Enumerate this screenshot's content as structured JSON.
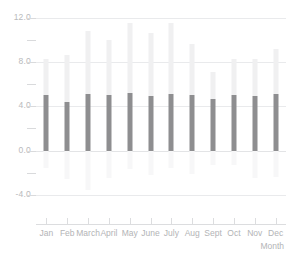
{
  "chart_data": {
    "type": "bar",
    "title": "",
    "subtitle": "",
    "xlabel": "Month",
    "ylabel": "",
    "categories": [
      "Jan",
      "Feb",
      "March",
      "April",
      "May",
      "June",
      "July",
      "Aug",
      "Sept",
      "Oct",
      "Nov",
      "Dec"
    ],
    "ylim": [
      -5.0,
      12.6
    ],
    "y_ticks_major": [
      "12.0",
      "8.0",
      "4.0",
      "0.0",
      "-4.0"
    ],
    "y_ticks_major_values": [
      12.0,
      8.0,
      4.0,
      0.0,
      -4.0
    ],
    "y_ticks_minor_values": [
      10.0,
      6.0,
      2.0,
      -2.0
    ],
    "grid": true,
    "legend": "none",
    "stacked": true,
    "series": [
      {
        "name": "lower",
        "color": "#f7f7f8",
        "values": [
          -1.6,
          -2.6,
          -3.6,
          -2.5,
          -1.7,
          -2.2,
          -1.6,
          -2.1,
          -1.3,
          -1.3,
          -2.5,
          -2.4
        ]
      },
      {
        "name": "middle",
        "color": "#8e8e90",
        "values": [
          5.0,
          4.4,
          5.1,
          5.0,
          5.2,
          4.9,
          5.1,
          5.0,
          4.7,
          5.0,
          4.9,
          5.1
        ]
      },
      {
        "name": "upper",
        "color": "#f0f0f1",
        "values": [
          3.3,
          4.2,
          5.7,
          5.0,
          6.3,
          5.7,
          6.4,
          4.6,
          2.4,
          3.3,
          3.4,
          4.1
        ]
      }
    ],
    "bar_tops": [
      8.3,
      8.6,
      10.8,
      10.0,
      11.5,
      10.6,
      11.5,
      9.6,
      7.1,
      8.3,
      8.3,
      9.2
    ],
    "bar_bottoms": [
      -1.6,
      -2.6,
      -3.6,
      -2.5,
      -1.7,
      -2.2,
      -1.6,
      -2.1,
      -1.3,
      -1.3,
      -2.5,
      -2.4
    ],
    "colors": {
      "bar_upper": "#f0f0f1",
      "bar_middle": "#8e8e90",
      "bar_lower": "#f7f7f8",
      "gridline": "#e9eaec",
      "axis": "#dcdddf",
      "tick_text": "#b3b4b6",
      "background": "#ffffff"
    }
  }
}
